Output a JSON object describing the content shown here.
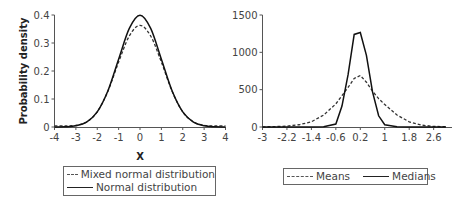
{
  "chart_data": [
    {
      "type": "line",
      "title": "",
      "xlabel": "X",
      "ylabel": "Probability density",
      "xlim": [
        -4,
        4
      ],
      "ylim": [
        0,
        0.4
      ],
      "x_ticks": [
        "-4",
        "-3",
        "-2",
        "-1",
        "0",
        "1",
        "2",
        "3",
        "4"
      ],
      "y_ticks": [
        "0",
        "0.1",
        "0.2",
        "0.3",
        "0.4"
      ],
      "grid": false,
      "legend_position": "bottom",
      "x": [
        -4,
        -3.5,
        -3,
        -2.5,
        -2,
        -1.5,
        -1,
        -0.5,
        0,
        0.5,
        1,
        1.5,
        2,
        2.5,
        3,
        3.5,
        4
      ],
      "series": [
        {
          "name": "Mixed normal distribution",
          "style": "dashed",
          "values": [
            0.004,
            0.004,
            0.006,
            0.018,
            0.054,
            0.128,
            0.232,
            0.325,
            0.363,
            0.325,
            0.232,
            0.128,
            0.054,
            0.018,
            0.006,
            0.004,
            0.004
          ]
        },
        {
          "name": "Normal distribution",
          "style": "solid",
          "values": [
            0.0001,
            0.0009,
            0.0044,
            0.0175,
            0.054,
            0.1295,
            0.242,
            0.352,
            0.399,
            0.352,
            0.242,
            0.1295,
            0.054,
            0.0175,
            0.0044,
            0.0009,
            0.0001
          ]
        }
      ]
    },
    {
      "type": "line",
      "title": "",
      "xlabel": "",
      "ylabel": "",
      "xlim": [
        -3,
        3.2
      ],
      "ylim": [
        0,
        1500
      ],
      "x_ticks": [
        "-3",
        "-2.2",
        "-1.4",
        "-0.6",
        "0.2",
        "1",
        "1.8",
        "2.6"
      ],
      "y_ticks": [
        "0",
        "500",
        "1000",
        "1500"
      ],
      "grid": false,
      "legend_position": "bottom",
      "x": [
        -3,
        -2.6,
        -2.2,
        -1.8,
        -1.4,
        -1.0,
        -0.6,
        -0.4,
        -0.2,
        0.0,
        0.2,
        0.4,
        0.6,
        0.8,
        1.0,
        1.4,
        1.8,
        2.2,
        2.6,
        3.0
      ],
      "series": [
        {
          "name": "Means",
          "style": "dashed",
          "values": [
            2,
            5,
            12,
            30,
            70,
            160,
            310,
            420,
            530,
            650,
            690,
            600,
            480,
            380,
            300,
            160,
            70,
            25,
            8,
            3
          ]
        },
        {
          "name": "Medians",
          "style": "solid",
          "values": [
            0,
            0,
            0,
            0,
            0,
            2,
            40,
            280,
            700,
            1240,
            1265,
            960,
            470,
            150,
            30,
            2,
            0,
            0,
            0,
            0
          ]
        }
      ]
    }
  ],
  "left_chart": {
    "ylabel": "Probability density",
    "xlabel": "X",
    "y_ticks": [
      "0",
      "0.1",
      "0.2",
      "0.3",
      "0.4"
    ],
    "x_ticks": [
      "-4",
      "-3",
      "-2",
      "-1",
      "0",
      "1",
      "2",
      "3",
      "4"
    ],
    "legend": [
      "Mixed normal distribution",
      "Normal distribution"
    ]
  },
  "right_chart": {
    "y_ticks": [
      "0",
      "500",
      "1000",
      "1500"
    ],
    "x_ticks": [
      "-3",
      "-2.2",
      "-1.4",
      "-0.6",
      "0.2",
      "1",
      "1.8",
      "2.6"
    ],
    "legend": [
      "Means",
      "Medians"
    ]
  }
}
